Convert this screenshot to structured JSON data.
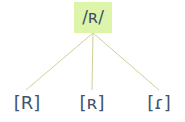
{
  "diagram": {
    "type": "phoneme-allophone-tree",
    "background_color": "#ffffff",
    "root": {
      "label": "/ʀ/",
      "highlight_color": "#ddf5ab",
      "text_color": "#3d4d63"
    },
    "edges": {
      "color": "#cfcf9a",
      "count": 3
    },
    "leaves": [
      {
        "label": "[R]",
        "text_color": "#41536d"
      },
      {
        "label": "[ʀ]",
        "text_color": "#41536d"
      },
      {
        "label": "[ɾ]",
        "text_color": "#41536d"
      }
    ]
  }
}
